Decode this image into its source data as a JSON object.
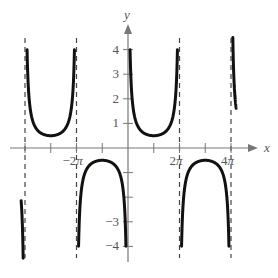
{
  "chart_data": {
    "type": "line",
    "title": "",
    "function": "y = 0.5 csc(x/2)",
    "xlabel": "x",
    "ylabel": "y",
    "xlim": [
      -4.15,
      5.5
    ],
    "ylim": [
      -4.5,
      4.5
    ],
    "x_unit": "pi",
    "x_ticks": [
      -4,
      -3,
      -2,
      -1,
      0,
      1,
      2,
      3,
      4
    ],
    "x_tick_labels": [
      {
        "value": -2,
        "label": "−2π"
      },
      {
        "value": 2,
        "label": "2π"
      },
      {
        "value": 4,
        "label": "4π"
      }
    ],
    "y_ticks": [
      -4,
      -3,
      -2,
      -1,
      1,
      2,
      3,
      4
    ],
    "y_tick_labels": [
      {
        "value": 4,
        "label": "4"
      },
      {
        "value": 3,
        "label": "3"
      },
      {
        "value": 2,
        "label": "2"
      },
      {
        "value": 1,
        "label": "1"
      },
      {
        "value": -3,
        "label": "−3"
      },
      {
        "value": -4,
        "label": "−4"
      }
    ],
    "asymptotes_x_pi": [
      -4,
      -2,
      0,
      2,
      4
    ],
    "branches": [
      {
        "from_pi": -4.15,
        "to_pi": -4,
        "sign": "negative",
        "extremum": null
      },
      {
        "from_pi": -4,
        "to_pi": -2,
        "sign": "positive",
        "extremum": {
          "x_pi": -3,
          "y": 0.5
        }
      },
      {
        "from_pi": -2,
        "to_pi": 0,
        "sign": "negative",
        "extremum": {
          "x_pi": -1,
          "y": -0.5
        }
      },
      {
        "from_pi": 0,
        "to_pi": 2,
        "sign": "positive",
        "extremum": {
          "x_pi": 1,
          "y": 0.5
        }
      },
      {
        "from_pi": 2,
        "to_pi": 4,
        "sign": "negative",
        "extremum": {
          "x_pi": 3,
          "y": -0.5
        }
      },
      {
        "from_pi": 4,
        "to_pi": 4.2,
        "sign": "positive",
        "extremum": null
      }
    ],
    "grid": false,
    "legend": null
  },
  "layout": {
    "origin_px": [
      128,
      148
    ],
    "px_per_pi": 25.75,
    "px_per_unit": 24.6,
    "curve_color": "#111111",
    "axis_color": "#777777",
    "asymptote_color": "#444444"
  }
}
